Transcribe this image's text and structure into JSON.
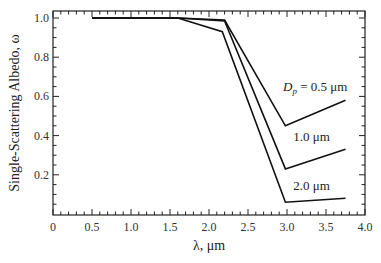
{
  "chart_data": {
    "type": "line",
    "title": "",
    "xlabel": "λ,  μm",
    "ylabel": "Single-Scattering  Albedo,  ω",
    "xlim": [
      0,
      4.0
    ],
    "ylim": [
      0,
      1.05
    ],
    "grid": false,
    "legend_position": "inline annotations",
    "x_ticks": [
      "0",
      "0.5",
      "1.0",
      "1.5",
      "2.0",
      "2.5",
      "3.0",
      "3.5",
      "4.0"
    ],
    "y_ticks": [
      "0.2",
      "0.4",
      "0.6",
      "0.8",
      "1.0"
    ],
    "series": [
      {
        "name": "D_p = 0.5 μm",
        "label": "0.5 μm",
        "x": [
          0.5,
          1.6,
          2.2,
          2.98,
          3.75
        ],
        "y": [
          1.0,
          1.0,
          0.99,
          0.45,
          0.58
        ]
      },
      {
        "name": "D_p = 1.0 μm",
        "label": "1.0 μm",
        "x": [
          0.5,
          1.6,
          2.2,
          2.98,
          3.75
        ],
        "y": [
          1.0,
          1.0,
          0.985,
          0.23,
          0.33
        ]
      },
      {
        "name": "D_p = 2.0 μm",
        "label": "2.0 μm",
        "x": [
          0.5,
          1.6,
          2.17,
          2.98,
          3.75
        ],
        "y": [
          1.0,
          1.0,
          0.93,
          0.06,
          0.08
        ]
      }
    ],
    "annotations": [
      {
        "text_prefix": "D",
        "text_sub": "p",
        "text_suffix": " = 0.5 μm",
        "x": 2.95,
        "y": 0.63
      },
      {
        "text": "1.0 μm",
        "x": 3.08,
        "y": 0.37
      },
      {
        "text": "2.0 μm",
        "x": 3.08,
        "y": 0.12
      }
    ]
  }
}
